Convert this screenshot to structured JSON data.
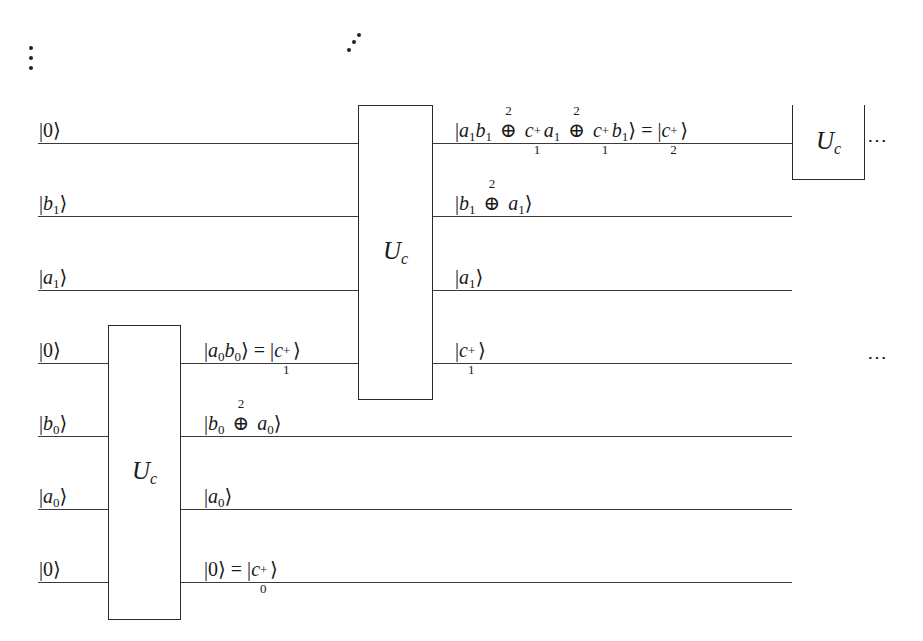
{
  "diagram": {
    "type": "quantum-circuit",
    "wires": [
      {
        "input": "|0⟩",
        "y": 143
      },
      {
        "input": "|b1⟩",
        "y": 216
      },
      {
        "input": "|a1⟩",
        "y": 290
      },
      {
        "input": "|0⟩",
        "y": 363
      },
      {
        "input": "|b0⟩",
        "y": 436
      },
      {
        "input": "|a0⟩",
        "y": 509
      },
      {
        "input": "|0⟩",
        "y": 582
      }
    ],
    "gates": [
      {
        "label": "U",
        "sub": "c",
        "wires": [
          3,
          4,
          5,
          6
        ]
      },
      {
        "label": "U",
        "sub": "c",
        "wires": [
          0,
          1,
          2,
          3
        ]
      },
      {
        "label": "U",
        "sub": "c",
        "wires": [
          0
        ],
        "note": "partially shown, continues upward"
      }
    ],
    "intermediate_labels": {
      "after_gate1": [
        "|a0b0⟩ = |c1+⟩",
        "|b0 ⊕² a0⟩",
        "|a0⟩",
        "|0⟩ = |c0+⟩"
      ],
      "after_gate2": [
        "|a1b1 ⊕² c1+a1 ⊕² c1+b1⟩ = |c2+⟩",
        "|b1 ⊕² a1⟩",
        "|a1⟩",
        "|c1+⟩"
      ]
    },
    "inputs": {
      "w0": {
        "sym": "0"
      },
      "w1": {
        "sym": "b",
        "sub": "1"
      },
      "w2": {
        "sym": "a",
        "sub": "1"
      },
      "w3": {
        "sym": "0"
      },
      "w4": {
        "sym": "b",
        "sub": "0"
      },
      "w5": {
        "sym": "a",
        "sub": "0"
      },
      "w6": {
        "sym": "0"
      }
    },
    "gate_label": "U",
    "gate_sub": "c",
    "continuation": "⋯",
    "operator_power": "2",
    "text": {
      "bar": "|",
      "rangle": "⟩",
      "eq": " = ",
      "oplus": "⊕",
      "plus": "+",
      "a": "a",
      "b": "b",
      "c": "c",
      "zero": "0",
      "one": "1",
      "two": "2"
    }
  }
}
